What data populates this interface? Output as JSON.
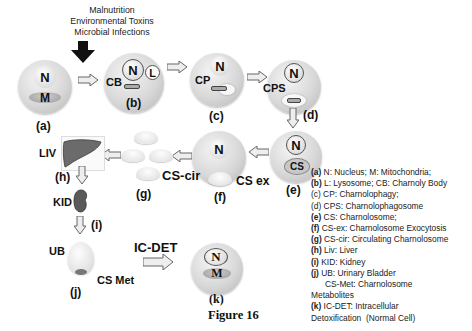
{
  "header": {
    "causes": [
      "Malnutrition",
      "Environmental Toxins",
      "Microbial Infections"
    ]
  },
  "stages": {
    "a": {
      "label": "(a)",
      "nucleus": "N",
      "mito": "M"
    },
    "b": {
      "label": "(b)",
      "nucleus": "N",
      "lysosome": "L",
      "body": "CB"
    },
    "c": {
      "label": "(c)",
      "nucleus": "N",
      "phagy": "CP"
    },
    "d": {
      "label": "(d)",
      "nucleus": "N",
      "phagosome": "CPS"
    },
    "e": {
      "label": "(e)",
      "nucleus": "N",
      "some": "CS"
    },
    "f": {
      "label": "(f)",
      "nucleus": "N",
      "exo": "CS ex"
    },
    "g": {
      "label": "(g)",
      "circ": "CS-cir"
    },
    "h": {
      "label": "(h)",
      "organ": "LIV"
    },
    "i": {
      "label": "(i)",
      "organ": "KID"
    },
    "j": {
      "label": "(j)",
      "organ": "UB",
      "met": "CS Met"
    },
    "k": {
      "label": "(k)",
      "nucleus": "N",
      "mito": "M",
      "path": "IC-DET"
    }
  },
  "legend": [
    {
      "key": "(a)",
      "text": " N: Nucleus;  M: Mitochondria;"
    },
    {
      "key": "(b)",
      "text": " L: Lysosome; CB: Charnoly Body"
    },
    {
      "key": "(c)",
      "text": "    CP: Charnolophagy;"
    },
    {
      "key": "(d)",
      "text": "    CPS: Charnolophagosome"
    },
    {
      "key": "(e)",
      "text": " CS: Charnolosome;"
    },
    {
      "key": "(f)",
      "text": "  CS-ex: Charnolosome Exocytosis"
    },
    {
      "key": "(g)",
      "text": " CS-cir: Circulating Charnolosome"
    },
    {
      "key": "(h)",
      "text": " Liv: Liver"
    },
    {
      "key": "(i)",
      "text": " KID: Kidney"
    },
    {
      "key": "(j)",
      "text": " UB: Urinary Bladder"
    },
    {
      "key": "",
      "text": "      CS-Met: Charnolosome"
    },
    {
      "key": "",
      "text": "Metabolites"
    },
    {
      "key": "(k)",
      "text": " IC-DET: Intracellular"
    },
    {
      "key": "",
      "text": "Detoxification  (Normal Cell)"
    }
  ],
  "caption": "Figure 16",
  "colors": {
    "cell": "#d0d0d0",
    "liver": "#6b6b6b",
    "arrow": "#e6e6e6",
    "text": "#111111"
  }
}
